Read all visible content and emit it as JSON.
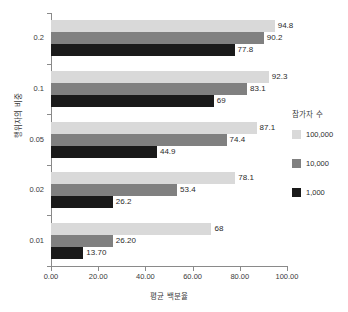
{
  "chart_data": {
    "type": "bar",
    "orientation": "horizontal",
    "title": "",
    "xlabel": "평균 백분율",
    "ylabel": "행위자의 비중",
    "categories": [
      "0.2",
      "0.1",
      "0.05",
      "0.02",
      "0.01"
    ],
    "series": [
      {
        "name": "100,000",
        "color": "#d9d9d9",
        "values": [
          94.8,
          92.3,
          87.1,
          78.1,
          68
        ],
        "labels": [
          "94.8",
          "92.3",
          "87.1",
          "78.1",
          "68"
        ]
      },
      {
        "name": "10,000",
        "color": "#808080",
        "values": [
          90.2,
          83.1,
          74.4,
          53.4,
          26.2
        ],
        "labels": [
          "90.2",
          "83.1",
          "74.4",
          "53.4",
          "26.20"
        ]
      },
      {
        "name": "1,000",
        "color": "#1a1a1a",
        "values": [
          77.8,
          69,
          44.9,
          26.2,
          13.7
        ],
        "labels": [
          "77.8",
          "69",
          "44.9",
          "26.2",
          "13.70"
        ]
      }
    ],
    "xlim": [
      0,
      100
    ],
    "xticks": [
      0,
      20,
      40,
      60,
      80,
      100
    ],
    "xtick_labels": [
      "0.00",
      "20.00",
      "40.00",
      "60.00",
      "80.00",
      "100.00"
    ],
    "grid": false,
    "legend": {
      "title": "참가자 수",
      "position": "right"
    }
  },
  "legend": {
    "title": "참가자 수",
    "entries": [
      {
        "label": "100,000",
        "color": "#d9d9d9"
      },
      {
        "label": "10,000",
        "color": "#808080"
      },
      {
        "label": "1,000",
        "color": "#1a1a1a"
      }
    ]
  },
  "axes": {
    "x_title": "평균 백분율",
    "y_title": "행위자의 비중",
    "x_tick_labels": [
      "0.00",
      "20.00",
      "40.00",
      "60.00",
      "80.00",
      "100.00"
    ],
    "y_tick_labels": [
      "0.2",
      "0.1",
      "0.05",
      "0.02",
      "0.01"
    ]
  }
}
